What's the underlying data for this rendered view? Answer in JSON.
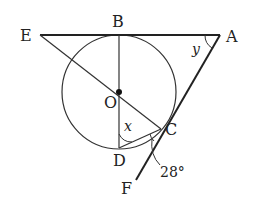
{
  "diagram": {
    "type": "geometry",
    "points": {
      "E": {
        "label": "E",
        "x": 40,
        "y": 35
      },
      "B": {
        "label": "B",
        "x": 119,
        "y": 35
      },
      "A": {
        "label": "A",
        "x": 220,
        "y": 35
      },
      "O": {
        "label": "O",
        "x": 119,
        "y": 92
      },
      "D": {
        "label": "D",
        "x": 119,
        "y": 148
      },
      "C": {
        "label": "C",
        "x": 161,
        "y": 129
      },
      "F": {
        "label": "F",
        "x": 136,
        "y": 180
      }
    },
    "circle": {
      "center": "O",
      "radius": 57
    },
    "angle_labels": {
      "x": "x",
      "y": "y",
      "given": "28°"
    },
    "colors": {
      "stroke": "#222222",
      "background": "#ffffff"
    }
  }
}
